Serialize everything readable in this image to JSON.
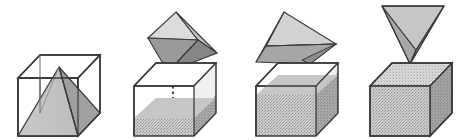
{
  "figure": {
    "description": "Four-stage sequence showing a square pyramid of the same base and height as a cube being emptied into the cube three times to exactly fill it.",
    "background_color": "#ffffff",
    "width": 475,
    "height": 140,
    "panel_count": 4
  },
  "palette": {
    "outline": "#3a3a3a",
    "outline_light": "#555555",
    "cube_face_empty": "#ffffff",
    "cube_face_right_dark": "#8f8f8f",
    "cube_face_top_shade": "#d6d6d6",
    "sand_light": "#cfcfcf",
    "sand_mid": "#bdbdbd",
    "sand_dark": "#9b9b9b",
    "pyramid_light": "#c9c9c9",
    "pyramid_mid": "#b0b0b0",
    "pyramid_dark": "#8d8d8d",
    "pyramid_pale": "#dcdcdc",
    "pour_line": "#4a4a4a"
  },
  "panels": [
    {
      "index": 1,
      "name": "pyramid-inscribed-in-cube",
      "caption": "",
      "cube": {
        "style": "wireframe",
        "fill_level_label": "empty",
        "fill_fraction": 0
      },
      "pyramid": {
        "state": "upright-inside-cube",
        "rotation_label": "0 degrees",
        "faces_visible": 2
      },
      "pour_stream": false
    },
    {
      "index": 2,
      "name": "first-pour-one-third-full",
      "caption": "",
      "cube": {
        "style": "solid",
        "fill_level_label": "one third",
        "fill_fraction": 0.33
      },
      "pyramid": {
        "state": "tipped-above-cube",
        "rotation_label": "tilted",
        "faces_visible": 4
      },
      "pour_stream": true
    },
    {
      "index": 3,
      "name": "second-pour-two-thirds-full",
      "caption": "",
      "cube": {
        "style": "solid",
        "fill_level_label": "two thirds",
        "fill_fraction": 0.66
      },
      "pyramid": {
        "state": "tipped-further-above-cube",
        "rotation_label": "tilted more",
        "faces_visible": 4
      },
      "pour_stream": true
    },
    {
      "index": 4,
      "name": "third-pour-completely-full",
      "caption": "",
      "cube": {
        "style": "solid",
        "fill_level_label": "full",
        "fill_fraction": 1
      },
      "pyramid": {
        "state": "inverted-apex-down",
        "rotation_label": "180 degrees",
        "faces_visible": 3
      },
      "pour_stream": false
    }
  ]
}
